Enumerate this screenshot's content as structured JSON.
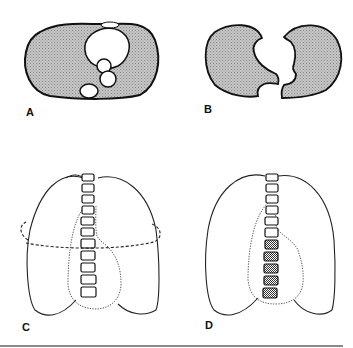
{
  "figure": {
    "panels": [
      {
        "id": "A",
        "label": "A",
        "description": "Axial cross-section of thorax with both lungs shaded and mediastinal structures (heart, vessels, spine) in white"
      },
      {
        "id": "B",
        "label": "B",
        "description": "Axial cross-section showing the two lungs separated, mediastinal outline cut out"
      },
      {
        "id": "C",
        "label": "C",
        "description": "Frontal view of lungs with vertebral column, dotted heart outline and dashed horizontal section plane"
      },
      {
        "id": "D",
        "label": "D",
        "description": "Frontal view of lungs with vertebral column (lower vertebrae shaded) and dotted heart outline"
      }
    ],
    "colors": {
      "stroke": "#111111",
      "fill_shade": "#b9b9b9",
      "background": "#ffffff",
      "rule": "#8a8a8a"
    }
  }
}
